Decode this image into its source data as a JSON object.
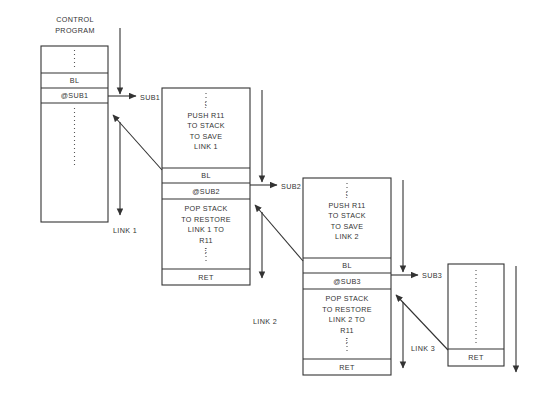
{
  "diagram": {
    "vertical_ellipsis": "⋮",
    "blocks": [
      {
        "id": "control-program",
        "heading_line1": "CONTROL",
        "heading_line2": "PROGRAM",
        "x": 41,
        "y": 46,
        "w": 67,
        "h": 176,
        "rows": [
          {
            "name": "control-ellipsis-top",
            "text": "⋮",
            "y": 46,
            "h": 27,
            "ellipsis": true
          },
          {
            "name": "control-bl",
            "text": "BL",
            "y": 73,
            "h": 15,
            "ellipsis": false
          },
          {
            "name": "control-sub1-ref",
            "text": "@SUB1",
            "y": 88,
            "h": 15,
            "ellipsis": false
          },
          {
            "name": "control-ellipsis-bottom",
            "text": "⋮",
            "y": 103,
            "h": 119,
            "ellipsis": true
          }
        ]
      },
      {
        "id": "sub1",
        "label": "SUB1",
        "label_x": 140,
        "label_y": 93,
        "x": 162,
        "y": 88,
        "w": 88,
        "h": 197,
        "rows": [
          {
            "name": "sub1-push",
            "text": "⋮\nPUSH R11\nTO STACK\nTO SAVE\nLINK 1",
            "y": 88,
            "h": 80,
            "ellipsis": false
          },
          {
            "name": "sub1-bl",
            "text": "BL",
            "y": 168,
            "h": 15,
            "ellipsis": false
          },
          {
            "name": "sub1-sub2-ref",
            "text": "@SUB2",
            "y": 183,
            "h": 16,
            "ellipsis": false
          },
          {
            "name": "sub1-pop",
            "text": "POP STACK\nTO RESTORE\nLINK 1 TO\nR11\n⋮",
            "y": 199,
            "h": 70,
            "ellipsis": false
          },
          {
            "name": "sub1-ret",
            "text": "RET",
            "y": 269,
            "h": 16,
            "ellipsis": false
          }
        ]
      },
      {
        "id": "sub2",
        "label": "SUB2",
        "label_x": 280,
        "label_y": 180,
        "x": 303,
        "y": 178,
        "w": 88,
        "h": 197,
        "rows": [
          {
            "name": "sub2-push",
            "text": "⋮\nPUSH R11\nTO STACK\nTO SAVE\nLINK 2",
            "y": 178,
            "h": 80,
            "ellipsis": false
          },
          {
            "name": "sub2-bl",
            "text": "BL",
            "y": 258,
            "h": 15,
            "ellipsis": false
          },
          {
            "name": "sub2-sub3-ref",
            "text": "@SUB3",
            "y": 273,
            "h": 16,
            "ellipsis": false
          },
          {
            "name": "sub2-pop",
            "text": "POP STACK\nTO RESTORE\nLINK 2 TO\nR11\n⋮",
            "y": 289,
            "h": 70,
            "ellipsis": false
          },
          {
            "name": "sub2-ret",
            "text": "RET",
            "y": 359,
            "h": 16,
            "ellipsis": false
          }
        ]
      },
      {
        "id": "sub3",
        "label": "SUB3",
        "label_x": 421,
        "label_y": 266,
        "x": 448,
        "y": 264,
        "w": 56,
        "h": 102,
        "rows": [
          {
            "name": "sub3-body",
            "text": "⋮",
            "y": 264,
            "h": 85,
            "ellipsis": true
          },
          {
            "name": "sub3-ret",
            "text": "RET",
            "y": 349,
            "h": 17,
            "ellipsis": false
          }
        ]
      }
    ],
    "link_labels": [
      {
        "name": "link-1-label",
        "text": "LINK 1",
        "x": 113,
        "y": 228
      },
      {
        "name": "link-2-label",
        "text": "LINK 2",
        "x": 253,
        "y": 318
      },
      {
        "name": "link-3-label",
        "text": "LINK 3",
        "x": 410,
        "y": 345
      }
    ],
    "colors": {
      "stroke": "#333333",
      "text": "#333333",
      "dotted": "#555555",
      "background": "#ffffff"
    }
  }
}
